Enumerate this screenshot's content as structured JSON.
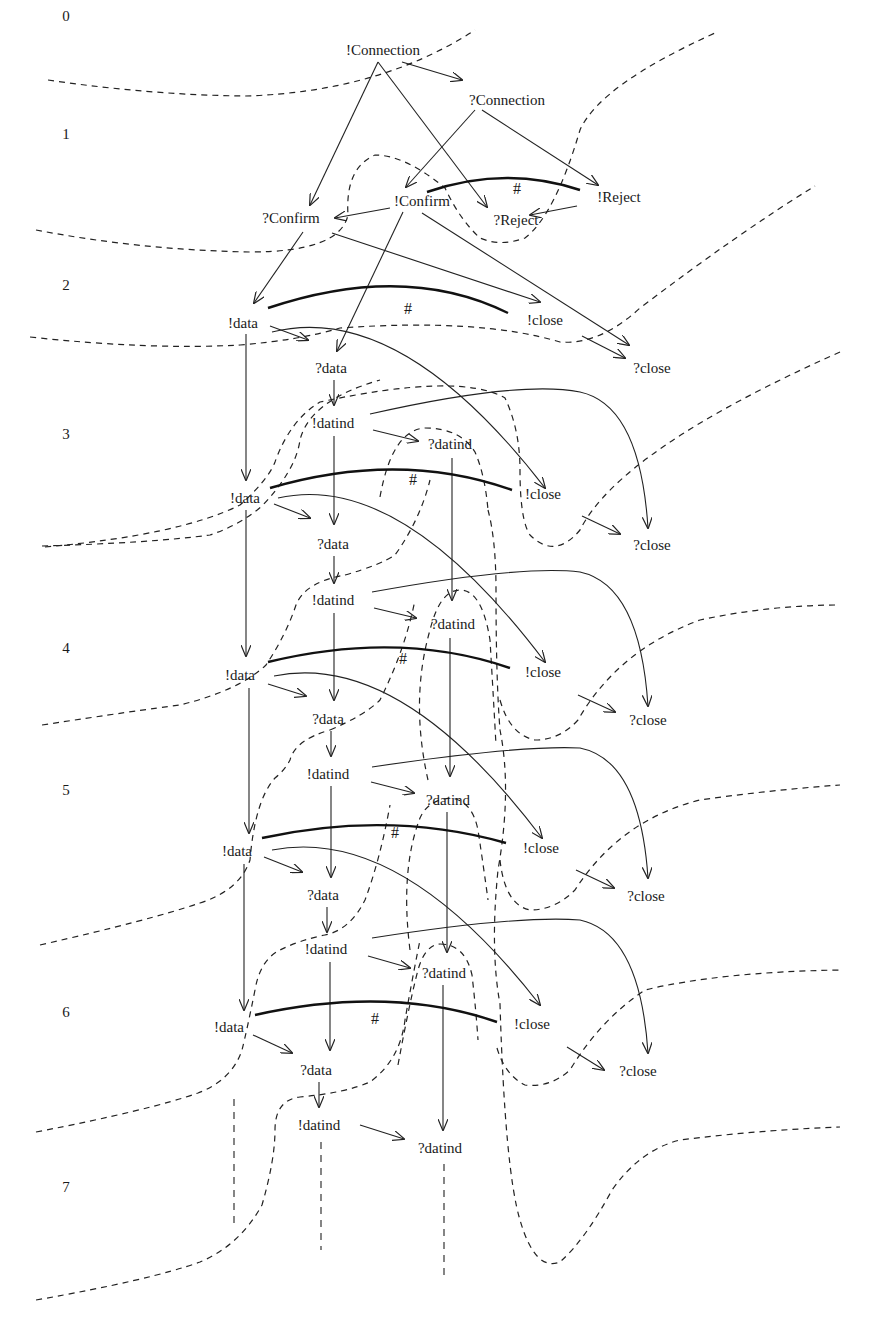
{
  "diagram": {
    "type": "event-structure-unfolding",
    "levels": [
      {
        "label": "0",
        "x": 66,
        "y": 18
      },
      {
        "label": "1",
        "x": 66,
        "y": 136
      },
      {
        "label": "2",
        "x": 66,
        "y": 287
      },
      {
        "label": "3",
        "x": 66,
        "y": 436
      },
      {
        "label": "4",
        "x": 66,
        "y": 650
      },
      {
        "label": "5",
        "x": 66,
        "y": 792
      },
      {
        "label": "6",
        "x": 66,
        "y": 1014
      },
      {
        "label": "7",
        "x": 66,
        "y": 1189
      }
    ],
    "nodes": [
      {
        "id": "n_conn_send",
        "label": "!Connection",
        "x": 383,
        "y": 52
      },
      {
        "id": "n_conn_recv",
        "label": "?Connection",
        "x": 507,
        "y": 102
      },
      {
        "id": "n_confirm_send",
        "label": "!Confirm",
        "x": 422,
        "y": 203
      },
      {
        "id": "n_reject_send",
        "label": "!Reject",
        "x": 619,
        "y": 199
      },
      {
        "id": "n_confirm_recv",
        "label": "?Confirm",
        "x": 291,
        "y": 220
      },
      {
        "id": "n_reject_recv",
        "label": "?Reject",
        "x": 516,
        "y": 222
      },
      {
        "id": "n_data_1",
        "label": "!data",
        "x": 243,
        "y": 325
      },
      {
        "id": "n_close_1",
        "label": "!close",
        "x": 545,
        "y": 322
      },
      {
        "id": "n_qdata_1",
        "label": "?data",
        "x": 331,
        "y": 370
      },
      {
        "id": "n_qclose_1",
        "label": "?close",
        "x": 652,
        "y": 370
      },
      {
        "id": "n_datind_1",
        "label": "!datind",
        "x": 333,
        "y": 425
      },
      {
        "id": "n_qdatind_1",
        "label": "?datind",
        "x": 450,
        "y": 446
      },
      {
        "id": "n_data_2",
        "label": "!data",
        "x": 245,
        "y": 500
      },
      {
        "id": "n_close_2",
        "label": "!close",
        "x": 543,
        "y": 496
      },
      {
        "id": "n_qdata_2",
        "label": "?data",
        "x": 333,
        "y": 546
      },
      {
        "id": "n_qclose_2",
        "label": "?close",
        "x": 652,
        "y": 547
      },
      {
        "id": "n_datind_2",
        "label": "!datind",
        "x": 333,
        "y": 602
      },
      {
        "id": "n_qdatind_2",
        "label": "?datind",
        "x": 453,
        "y": 626
      },
      {
        "id": "n_data_3",
        "label": "!data",
        "x": 240,
        "y": 677
      },
      {
        "id": "n_close_3",
        "label": "!close",
        "x": 543,
        "y": 674
      },
      {
        "id": "n_qdata_3",
        "label": "?data",
        "x": 328,
        "y": 721
      },
      {
        "id": "n_qclose_3",
        "label": "?close",
        "x": 648,
        "y": 722
      },
      {
        "id": "n_datind_3",
        "label": "!datind",
        "x": 328,
        "y": 776
      },
      {
        "id": "n_qdatind_3",
        "label": "?datind",
        "x": 448,
        "y": 802
      },
      {
        "id": "n_data_4",
        "label": "!data",
        "x": 237,
        "y": 853
      },
      {
        "id": "n_close_4",
        "label": "!close",
        "x": 541,
        "y": 850
      },
      {
        "id": "n_qdata_4",
        "label": "?data",
        "x": 323,
        "y": 897
      },
      {
        "id": "n_qclose_4",
        "label": "?close",
        "x": 646,
        "y": 898
      },
      {
        "id": "n_datind_4",
        "label": "!datind",
        "x": 326,
        "y": 951
      },
      {
        "id": "n_qdatind_4",
        "label": "?datind",
        "x": 444,
        "y": 975
      },
      {
        "id": "n_data_5",
        "label": "!data",
        "x": 229,
        "y": 1029
      },
      {
        "id": "n_close_5",
        "label": "!close",
        "x": 532,
        "y": 1026
      },
      {
        "id": "n_qdata_5",
        "label": "?data",
        "x": 316,
        "y": 1072
      },
      {
        "id": "n_qclose_5",
        "label": "?close",
        "x": 638,
        "y": 1073
      },
      {
        "id": "n_datind_5",
        "label": "!datind",
        "x": 319,
        "y": 1127
      },
      {
        "id": "n_qdatind_5",
        "label": "?datind",
        "x": 440,
        "y": 1150
      }
    ],
    "conflict_marker": "#",
    "conflicts": [
      {
        "d": "M427,192 Q505,165 580,190",
        "hash_x": 517,
        "hash_y": 194
      },
      {
        "d": "M268,308 Q405,262 508,313",
        "hash_x": 408,
        "hash_y": 314
      },
      {
        "d": "M270,488 Q400,450 512,490",
        "hash_x": 413,
        "hash_y": 485
      },
      {
        "d": "M268,662 Q400,630 510,668",
        "hash_x": 403,
        "hash_y": 664
      },
      {
        "d": "M262,838 Q390,810 506,843",
        "hash_x": 395,
        "hash_y": 838
      },
      {
        "d": "M255,1015 Q390,985 497,1022",
        "hash_x": 375,
        "hash_y": 1024
      }
    ],
    "edges": [
      {
        "d": "M378,62 L310,205",
        "arrow": true
      },
      {
        "d": "M378,62 L487,207",
        "arrow": true
      },
      {
        "d": "M402,62 L462,80",
        "arrow": true
      },
      {
        "d": "M475,110 L406,187",
        "arrow": true
      },
      {
        "d": "M482,110 L598,185",
        "arrow": true
      },
      {
        "d": "M390,208 L335,218",
        "arrow": true
      },
      {
        "d": "M577,206 L530,215",
        "arrow": true
      },
      {
        "d": "M303,232 L254,303",
        "arrow": true
      },
      {
        "d": "M332,233 L540,302",
        "arrow": true
      },
      {
        "d": "M403,212 L337,351",
        "arrow": true
      },
      {
        "d": "M422,213 L629,345",
        "arrow": true
      },
      {
        "d": "M270,326 L308,340",
        "arrow": true
      },
      {
        "d": "M272,332 Q400,300 545,488",
        "arrow": true
      },
      {
        "d": "M582,336 L625,358",
        "arrow": true
      },
      {
        "d": "M246,334 L246,480",
        "arrow": true
      },
      {
        "d": "M334,380 L334,405",
        "arrow": true
      },
      {
        "d": "M370,414 Q520,380 580,392 Q640,405 648,528",
        "arrow": true
      },
      {
        "d": "M373,430 L418,441",
        "arrow": true
      },
      {
        "d": "M334,436 L334,524",
        "arrow": true
      },
      {
        "d": "M452,458 L452,600",
        "arrow": true
      },
      {
        "d": "M274,504 L310,518",
        "arrow": true
      },
      {
        "d": "M278,498 Q400,470 545,662",
        "arrow": true
      },
      {
        "d": "M582,516 L620,534",
        "arrow": true
      },
      {
        "d": "M246,510 L246,656",
        "arrow": true
      },
      {
        "d": "M334,556 L334,583",
        "arrow": true
      },
      {
        "d": "M372,592 Q520,565 580,572 Q640,585 648,706",
        "arrow": true
      },
      {
        "d": "M374,608 L416,618",
        "arrow": true
      },
      {
        "d": "M334,613 L334,700",
        "arrow": true
      },
      {
        "d": "M450,638 L450,776",
        "arrow": true
      },
      {
        "d": "M268,684 L306,696",
        "arrow": true
      },
      {
        "d": "M274,676 Q400,650 542,838",
        "arrow": true
      },
      {
        "d": "M578,695 L615,712",
        "arrow": true
      },
      {
        "d": "M249,688 L249,833",
        "arrow": true
      },
      {
        "d": "M331,731 L331,756",
        "arrow": true
      },
      {
        "d": "M372,767 Q520,745 580,748 Q640,760 648,878",
        "arrow": true
      },
      {
        "d": "M371,782 L414,793",
        "arrow": true
      },
      {
        "d": "M331,786 L331,877",
        "arrow": true
      },
      {
        "d": "M447,812 L447,952",
        "arrow": true
      },
      {
        "d": "M264,857 L302,872",
        "arrow": true
      },
      {
        "d": "M272,850 Q400,825 540,1005",
        "arrow": true
      },
      {
        "d": "M576,870 L614,888",
        "arrow": true
      },
      {
        "d": "M244,864 L244,1010",
        "arrow": true
      },
      {
        "d": "M327,907 L327,932",
        "arrow": true
      },
      {
        "d": "M372,938 Q520,915 580,920 Q640,933 648,1053",
        "arrow": true
      },
      {
        "d": "M368,956 L410,968",
        "arrow": true
      },
      {
        "d": "M330,962 L330,1050",
        "arrow": true
      },
      {
        "d": "M443,985 L443,1130",
        "arrow": true
      },
      {
        "d": "M253,1035 L292,1053",
        "arrow": true
      },
      {
        "d": "M567,1047 L604,1070",
        "arrow": true
      },
      {
        "d": "M319,1082 L319,1107",
        "arrow": true
      },
      {
        "d": "M360,1125 L404,1139",
        "arrow": true
      }
    ],
    "tails": [
      {
        "d": "M234,1099 L234,1225"
      },
      {
        "d": "M321,1142 L321,1250"
      },
      {
        "d": "M444,1164 L444,1278"
      }
    ],
    "cuts": [
      {
        "d": "M48,80 Q150,95 245,96 Q380,92 475,30"
      },
      {
        "d": "M36,230 Q140,250 250,252 Q340,252 348,215 Q345,168 375,155 Q405,155 445,188 Q460,220 480,238 Q500,247 525,238 Q555,215 580,130 Q600,85 715,33"
      },
      {
        "d": "M30,337 Q150,350 240,345 Q300,340 340,328 Q480,318 560,342 Q600,345 640,308 Q740,232 815,186"
      },
      {
        "d": "M45,547 Q180,535 240,505 Q268,480 275,462 Q290,420 320,402 Q460,372 505,398 Q520,430 520,470 Q520,520 530,535 Q555,560 580,530 Q620,450 840,352"
      },
      {
        "d": "M42,546 Q150,543 210,535 Q240,525 262,506 Q296,470 300,440 Q310,400 380,380"
      },
      {
        "d": "M380,497 Q392,430 425,428 Q460,428 475,452 Q485,475 488,510"
      },
      {
        "d": "M488,510 Q496,540 496,590 Q496,680 500,730 Q512,790 498,870 Q490,950 500,1004 Q505,1170 520,1220 Q535,1272 560,1262 Q585,1240 612,1190 Q640,1150 680,1140 Q760,1130 840,1127"
      },
      {
        "d": "M42,725 Q140,710 180,705 Q240,690 266,665 Q286,635 296,605 Q305,582 345,575"
      },
      {
        "d": "M345,575 Q380,565 395,555 Q420,520 430,480"
      },
      {
        "d": "M428,780 Q410,700 430,630 Q440,590 460,590 Q482,590 490,640 Q493,690 496,745"
      },
      {
        "d": "M500,700 Q510,735 535,740 Q560,740 578,720 Q618,650 700,620 Q770,605 840,605"
      },
      {
        "d": "M40,945 Q150,920 200,903 Q240,890 250,860 Q255,800 275,778 Q285,770 290,760 Q295,740 330,730"
      },
      {
        "d": "M330,730 Q365,715 380,700 Q405,650 415,600"
      },
      {
        "d": "M410,950 Q400,870 420,818 Q428,800 450,798 Q472,800 478,830 Q484,870 488,900"
      },
      {
        "d": "M500,860 Q505,905 530,910 Q555,910 575,890 Q620,820 700,800 Q770,790 840,785"
      },
      {
        "d": "M36,1132 Q150,1110 198,1093 Q232,1080 242,1050 Q247,1030 255,990 Q260,960 280,950 Q300,940 325,935 Q350,930 365,900 Q380,860 390,805"
      },
      {
        "d": "M398,1065 Q410,1000 418,970 Q425,945 440,944"
      },
      {
        "d": "M440,944 Q465,944 472,975 Q476,1010 478,1040"
      },
      {
        "d": "M497,1048 Q505,1075 525,1085 Q550,1088 570,1070 Q600,1020 645,990 Q720,972 840,970"
      },
      {
        "d": "M36,1300 Q150,1280 200,1262 Q240,1245 262,1205 Q275,1160 275,1130 Q275,1100 300,1097 Q345,1093 370,1082 Q400,1060 405,1020 Q412,980 420,940"
      }
    ]
  }
}
